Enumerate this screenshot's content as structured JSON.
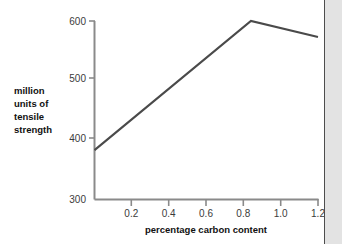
{
  "chart_data": {
    "type": "line",
    "title": "",
    "xlabel": "percentage carbon content",
    "ylabel": "million units of tensile strength",
    "ylabel_lines": [
      "million",
      "units of",
      "tensile",
      "strength"
    ],
    "x": [
      0.0,
      0.84,
      1.2
    ],
    "values": [
      383,
      600,
      573
    ],
    "series": [
      {
        "name": "tensile strength",
        "points": [
          {
            "x": 0.0,
            "y": 383
          },
          {
            "x": 0.84,
            "y": 600
          },
          {
            "x": 1.2,
            "y": 573
          }
        ]
      }
    ],
    "xlim": [
      0.0,
      1.2
    ],
    "ylim": [
      300,
      600
    ],
    "xticks": [
      0.2,
      0.4,
      0.6,
      0.8,
      1.0,
      1.2
    ],
    "xtick_labels": [
      "0.2",
      "0.4",
      "0.6",
      "0.8",
      "1.0",
      "1.2"
    ],
    "yticks": [
      300,
      400,
      500,
      600
    ],
    "ytick_labels": [
      "300",
      "400",
      "500",
      "600"
    ],
    "grid": false,
    "legend": null,
    "line_color": "#4a4a4a",
    "axis_color": "#8a8a8a",
    "background_color": "#ffffff"
  },
  "decoration": {
    "right_rule_color": "#4d4d4d",
    "right_panel_color": "#e3e3e3"
  }
}
